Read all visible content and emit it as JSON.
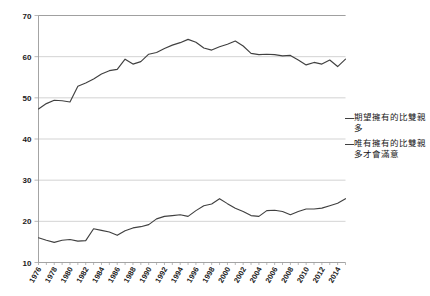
{
  "chart_data": {
    "type": "line",
    "title": "",
    "xlabel": "",
    "ylabel": "",
    "ylim": [
      10,
      70
    ],
    "ytick_values": [
      10,
      20,
      30,
      40,
      50,
      60,
      70
    ],
    "grid": true,
    "legend_position": "right",
    "x": [
      1976,
      1977,
      1978,
      1979,
      1980,
      1981,
      1982,
      1983,
      1984,
      1985,
      1986,
      1987,
      1988,
      1989,
      1990,
      1991,
      1992,
      1993,
      1994,
      1995,
      1996,
      1997,
      1998,
      1999,
      2000,
      2001,
      2002,
      2003,
      2004,
      2005,
      2006,
      2007,
      2008,
      2009,
      2010,
      2011,
      2012,
      2013,
      2014,
      2015
    ],
    "xtick_labels": [
      "1976",
      "1978",
      "1980",
      "1982",
      "1984",
      "1986",
      "1988",
      "1990",
      "1992",
      "1994",
      "1996",
      "1998",
      "2000",
      "2002",
      "2004",
      "2006",
      "2008",
      "2010",
      "2012",
      "2014"
    ],
    "series": [
      {
        "name": "期望擁有的比雙親多",
        "values": [
          47.3,
          48.6,
          49.4,
          49.3,
          49.0,
          52.8,
          53.6,
          54.6,
          55.8,
          56.6,
          56.9,
          59.4,
          58.2,
          58.8,
          60.6,
          61.0,
          62.0,
          62.8,
          63.4,
          64.2,
          63.5,
          62.1,
          61.6,
          62.4,
          63.0,
          63.8,
          62.6,
          60.8,
          60.5,
          60.6,
          60.5,
          60.2,
          60.3,
          59.2,
          58.0,
          58.6,
          58.2,
          59.2,
          57.6,
          59.4
        ]
      },
      {
        "name": "唯有擁有的比雙親多才會滿意",
        "values": [
          16.0,
          15.4,
          14.9,
          15.4,
          15.6,
          15.2,
          15.3,
          18.2,
          17.8,
          17.4,
          16.6,
          17.7,
          18.4,
          18.7,
          19.2,
          20.6,
          21.2,
          21.4,
          21.6,
          21.2,
          22.6,
          23.8,
          24.2,
          25.5,
          24.3,
          23.2,
          22.4,
          21.4,
          21.2,
          22.6,
          22.7,
          22.4,
          21.6,
          22.4,
          23.0,
          23.0,
          23.2,
          23.8,
          24.4,
          25.5
        ]
      }
    ]
  },
  "legend": {
    "entries": [
      {
        "marker": "line-dash",
        "label": "期望擁有的比雙親多"
      },
      {
        "marker": "line-dash",
        "label": "唯有擁有的比雙親多才會滿意"
      }
    ]
  },
  "axis": {
    "y_labels": [
      "70",
      "60",
      "50",
      "40",
      "30",
      "20",
      "10"
    ],
    "x_labels": [
      "1976",
      "1978",
      "1980",
      "1982",
      "1984",
      "1986",
      "1988",
      "1990",
      "1992",
      "1994",
      "1996",
      "1998",
      "2000",
      "2002",
      "2004",
      "2006",
      "2008",
      "2010",
      "2012",
      "2014"
    ]
  },
  "colors": {
    "line": "#404040",
    "grid": "#c8c8c8",
    "axis": "#9a9a9a",
    "text": "#1a1a1a",
    "background": "#ffffff"
  }
}
